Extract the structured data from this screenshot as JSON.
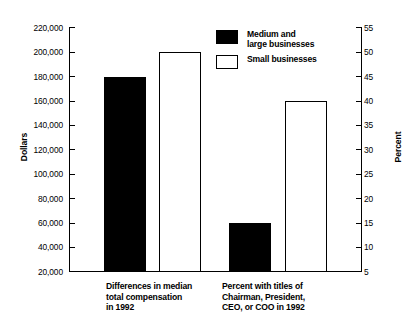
{
  "chart_data": {
    "type": "bar",
    "title": "",
    "subtitle": "",
    "categories": [
      "Differences in median\ntotal compensation\nin 1992",
      "Percent with titles of\nChairman, President,\nCEO, or COO in 1992"
    ],
    "series": [
      {
        "name": "Medium and\nlarge businesses",
        "style": "filled-black",
        "values": [
          180000,
          15
        ],
        "axis": [
          "left",
          "right"
        ]
      },
      {
        "name": "Small businesses",
        "style": "hollow-white",
        "values": [
          200000,
          40
        ],
        "axis": [
          "left",
          "right"
        ]
      }
    ],
    "xlabel": "",
    "ylabel": "Dollars",
    "ylabel_right": "Percent",
    "ylim": [
      20000,
      220000
    ],
    "ylim_right": [
      5,
      55
    ],
    "ytick_step": 20000,
    "ytick_step_right": 5,
    "yticks": [
      "220,000",
      "200,000",
      "180,000",
      "160,000",
      "140,000",
      "120,000",
      "100,000",
      "80,000",
      "60,000",
      "40,000",
      "20,000"
    ],
    "yticks_right": [
      "55",
      "50",
      "45",
      "40",
      "35",
      "30",
      "25",
      "20",
      "15",
      "10",
      "5"
    ],
    "grid": false,
    "legend_position": "top-center",
    "colors": {
      "series_1": "#000000",
      "series_2": "#ffffff",
      "axis": "#000000",
      "background": "#ffffff"
    }
  },
  "legend": {
    "items": [
      {
        "label": "Medium and\nlarge businesses",
        "swatch": "filled"
      },
      {
        "label": "Small businesses",
        "swatch": "hollow"
      }
    ]
  },
  "axes": {
    "left_title": "Dollars",
    "right_title": "Percent"
  }
}
